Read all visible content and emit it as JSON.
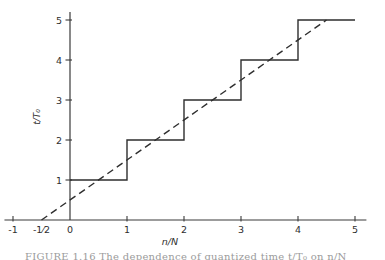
{
  "figure": {
    "caption": "FIGURE 1.16   The dependence of quantized time t/T₀ on n/N"
  },
  "colors": {
    "line": "#2e2e2e",
    "axis": "#3a3a3a",
    "label": "#2e2e2e",
    "background": "#ffffff",
    "caption": "#9b9b9b"
  },
  "chart_data": {
    "type": "line",
    "title": "",
    "xlabel": "n/N",
    "ylabel": "t/T₀",
    "xlim": [
      -1.15,
      5.2
    ],
    "ylim": [
      0,
      5.2
    ],
    "grid": false,
    "legend": "none",
    "x_tick_marks": [
      -1,
      1,
      2,
      3,
      4,
      5
    ],
    "x_tick_labels": [
      {
        "value": -1,
        "label": "-1"
      },
      {
        "value": -0.5,
        "label": "-1⁄2"
      },
      {
        "value": 0,
        "label": "0"
      },
      {
        "value": 1,
        "label": "1"
      },
      {
        "value": 2,
        "label": "2"
      },
      {
        "value": 3,
        "label": "3"
      },
      {
        "value": 4,
        "label": "4"
      },
      {
        "value": 5,
        "label": "5"
      }
    ],
    "y_tick_marks": [
      1,
      2,
      3,
      4,
      5
    ],
    "y_tick_labels": [
      {
        "value": 1,
        "label": "1"
      },
      {
        "value": 2,
        "label": "2"
      },
      {
        "value": 3,
        "label": "3"
      },
      {
        "value": 4,
        "label": "4"
      },
      {
        "value": 5,
        "label": "5"
      }
    ],
    "series": [
      {
        "name": "staircase-step-function",
        "style": "solid",
        "points": [
          [
            0,
            1
          ],
          [
            1,
            1
          ],
          [
            1,
            2
          ],
          [
            2,
            2
          ],
          [
            2,
            3
          ],
          [
            3,
            3
          ],
          [
            3,
            4
          ],
          [
            4,
            4
          ],
          [
            4,
            5
          ],
          [
            5,
            5
          ]
        ]
      },
      {
        "name": "ideal-dashed-line",
        "style": "dashed",
        "points": [
          [
            -0.5,
            0
          ],
          [
            4.5,
            5
          ]
        ]
      }
    ]
  }
}
